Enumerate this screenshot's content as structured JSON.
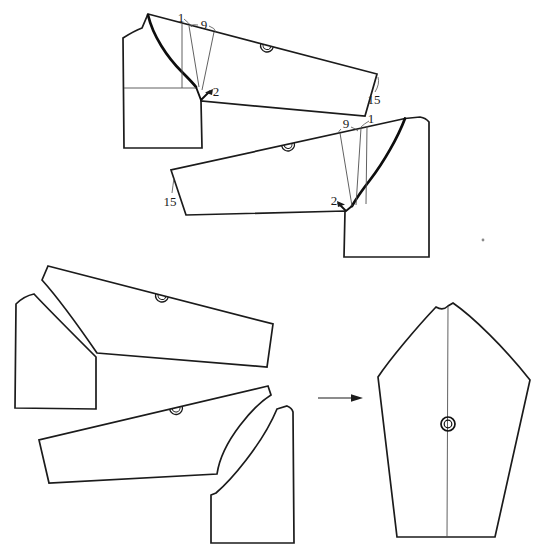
{
  "colors": {
    "background": "#ffffff",
    "ink": "#1b1b1b",
    "bold_curve": "#0d0d0d",
    "construction_line": "#4f4f4f"
  },
  "marks": {
    "sleeve_cap_notch": "half-circle-notch",
    "center_mark": "double-circle",
    "flow_mark": "right-arrow"
  },
  "annotations": {
    "top_front_piece": {
      "shoulder_gap": "1",
      "spread_amount": "9",
      "underarm_point": "2",
      "cuff_measure": "15"
    },
    "top_back_piece": {
      "shoulder_gap": "1",
      "spread_amount": "9",
      "underarm_point": "2",
      "cuff_measure": "15"
    }
  }
}
